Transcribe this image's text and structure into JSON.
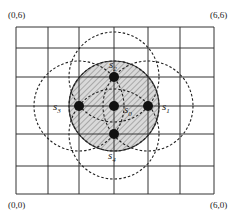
{
  "corners": {
    "top_left": "(0,6)",
    "top_right": "(6,6)",
    "bottom_left": "(0,0)",
    "bottom_right": "(6,0)"
  },
  "grid": {
    "x_lines": [
      16,
      48,
      79,
      114,
      148,
      180,
      214
    ],
    "y_lines": [
      27,
      48,
      77,
      106,
      134,
      166,
      194
    ],
    "stroke": "#333333"
  },
  "coverage_circle": {
    "cx": 114,
    "cy": 106,
    "r": 45,
    "fill": "#d9d9d9",
    "stroke": "#444444",
    "hatched": true
  },
  "nodes": [
    {
      "id": "s0",
      "letter": "s",
      "sub": "0",
      "cx": 114,
      "cy": 106,
      "label_x": 124,
      "label_y": 113
    },
    {
      "id": "s1",
      "letter": "s",
      "sub": "1",
      "cx": 148,
      "cy": 106,
      "label_x": 162,
      "label_y": 110
    },
    {
      "id": "s2",
      "letter": "s",
      "sub": "2",
      "cx": 114,
      "cy": 77,
      "label_x": 109,
      "label_y": 68
    },
    {
      "id": "s3",
      "letter": "s",
      "sub": "3",
      "cx": 79,
      "cy": 106,
      "label_x": 53,
      "label_y": 110
    },
    {
      "id": "s4",
      "letter": "s",
      "sub": "4",
      "cx": 114,
      "cy": 134,
      "label_x": 108,
      "label_y": 159
    }
  ],
  "dashed_circles": [
    {
      "of": "s0",
      "cx": 114,
      "cy": 106,
      "r": 45
    },
    {
      "of": "s1",
      "cx": 148,
      "cy": 106,
      "r": 45
    },
    {
      "of": "s2",
      "cx": 114,
      "cy": 77,
      "r": 45
    },
    {
      "of": "s3",
      "cx": 79,
      "cy": 106,
      "r": 45
    },
    {
      "of": "s4",
      "cx": 114,
      "cy": 134,
      "r": 45
    }
  ]
}
